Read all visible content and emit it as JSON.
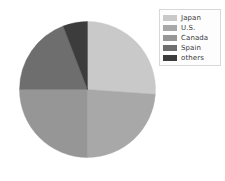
{
  "chart_data": {
    "type": "pie",
    "title": "",
    "subtitle": "",
    "xlabel": "",
    "ylabel": "",
    "legend_position": "top-right",
    "grid": false,
    "start_angle_deg": 0,
    "direction": "clockwise",
    "categories": [
      "Japan",
      "U.S.",
      "Canada",
      "Spain",
      "others"
    ],
    "values": [
      26,
      24,
      25,
      19,
      6
    ],
    "units": "percent",
    "colors": [
      "#c9c9c9",
      "#a8a8a8",
      "#969696",
      "#6e6e6e",
      "#3c3c3c"
    ],
    "slices": [
      {
        "label": "Japan",
        "value": 26,
        "color": "#c9c9c9",
        "start_deg": 0,
        "end_deg": 94
      },
      {
        "label": "U.S.",
        "value": 24,
        "color": "#a8a8a8",
        "start_deg": 94,
        "end_deg": 180
      },
      {
        "label": "Canada",
        "value": 25,
        "color": "#969696",
        "start_deg": 180,
        "end_deg": 270
      },
      {
        "label": "Spain",
        "value": 19,
        "color": "#6e6e6e",
        "start_deg": 270,
        "end_deg": 339
      },
      {
        "label": "others",
        "value": 6,
        "color": "#3c3c3c",
        "start_deg": 339,
        "end_deg": 360
      }
    ]
  },
  "legend": {
    "items": [
      {
        "label": "Japan",
        "color": "#c9c9c9"
      },
      {
        "label": "U.S.",
        "color": "#a8a8a8"
      },
      {
        "label": "Canada",
        "color": "#969696"
      },
      {
        "label": "Spain",
        "color": "#6e6e6e"
      },
      {
        "label": "others",
        "color": "#3c3c3c"
      }
    ]
  },
  "caption": ""
}
